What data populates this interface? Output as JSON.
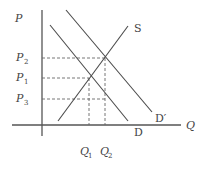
{
  "diagram": {
    "type": "supply-demand",
    "axes": {
      "y_label": "P",
      "x_label": "Q"
    },
    "curves": [
      {
        "id": "S",
        "label": "S",
        "kind": "supply"
      },
      {
        "id": "D",
        "label": "D",
        "kind": "demand"
      },
      {
        "id": "D_prime",
        "label": "D′",
        "kind": "shifted-demand"
      }
    ],
    "price_levels": [
      {
        "id": "P2",
        "base": "P",
        "sub": "2"
      },
      {
        "id": "P1",
        "base": "P",
        "sub": "1"
      },
      {
        "id": "P3",
        "base": "P",
        "sub": "3"
      }
    ],
    "quantity_levels": [
      {
        "id": "Q1",
        "base": "Q",
        "sub": "1"
      },
      {
        "id": "Q2",
        "base": "Q",
        "sub": "2"
      }
    ],
    "colors": {
      "line": "#4a4a4a",
      "text": "#444444",
      "background": "#ffffff"
    }
  }
}
